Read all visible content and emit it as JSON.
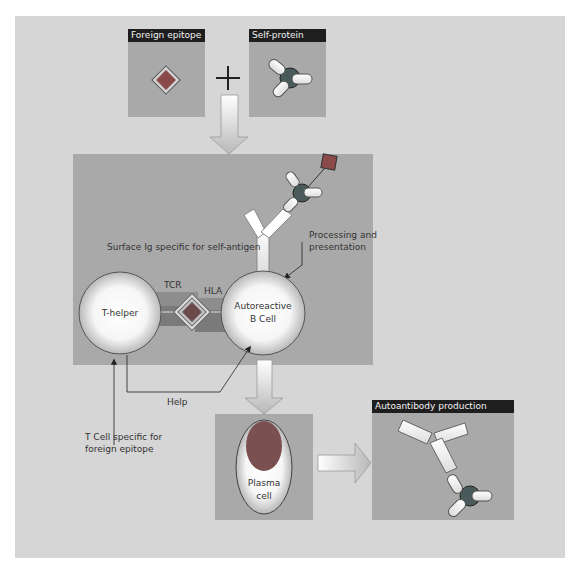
{
  "panels": {
    "foreign_epitope": {
      "title": "Foreign epitope"
    },
    "self_protein": {
      "title": "Self-protein"
    },
    "autoantibody": {
      "title": "Autoantibody production"
    }
  },
  "labels": {
    "surface_ig": "Surface Ig specific for self-antigen",
    "processing_line1": "Processing and",
    "processing_line2": "presentation",
    "tcr": "TCR",
    "hla": "HLA",
    "help": "Help",
    "t_cell_line1": "T Cell specific for",
    "t_cell_line2": "foreign epitope"
  },
  "cells": {
    "t_helper": "T-helper",
    "b_cell_line1": "Autoreactive",
    "b_cell_line2": "B Cell",
    "plasma_line1": "Plasma",
    "plasma_line2": "cell"
  },
  "symbols": {
    "plus": "+"
  },
  "colors": {
    "outer_bg": "#d6d6d6",
    "box_bg": "#a9a9a9",
    "header_bg": "#1e1e1e",
    "epitope_fill": "#8a4a4a",
    "protein_core": "#4a5a5a",
    "nucleus": "#7a5050"
  }
}
